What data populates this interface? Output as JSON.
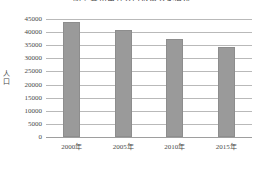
{
  "chart_data": {
    "type": "bar",
    "title": "图 2  各市常住人口数量变化情况",
    "title_clipped": true,
    "xlabel": "",
    "ylabel": "人口",
    "ylabel_chars": [
      "人",
      "口"
    ],
    "categories": [
      "2000年",
      "2005年",
      "2010年",
      "2015年"
    ],
    "values": [
      44000,
      40700,
      37500,
      34300
    ],
    "ylim": [
      0,
      45000
    ],
    "ytick_step": 5000,
    "yticks": [
      45000,
      40000,
      35000,
      30000,
      25000,
      20000,
      15000,
      10000,
      5000,
      0
    ],
    "ytick_labels": [
      "45000",
      "40000",
      "35000",
      "30000",
      "25000",
      "20000",
      "15000",
      "10000",
      "5000",
      "0"
    ],
    "grid": true,
    "legend": false,
    "series": [
      {
        "name": "人口",
        "values": [
          44000,
          40700,
          37500,
          34300
        ],
        "color": "#9a9a9a"
      }
    ],
    "colors": {
      "bar_fill": "#9a9a9a",
      "bar_border": "#8d8d8d",
      "gridline": "#b9b9b9",
      "baseline": "#9e9e9e",
      "text": "#4a4a4a",
      "background": "#ffffff"
    }
  }
}
